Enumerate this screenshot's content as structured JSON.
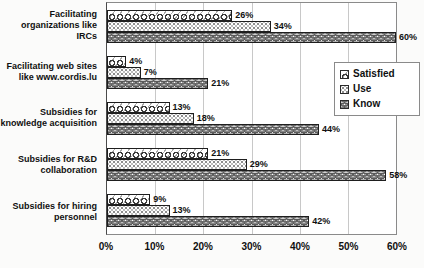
{
  "chart_data": {
    "type": "bar",
    "orientation": "horizontal",
    "title": "",
    "categories": [
      "Facilitating organizations like IRCs",
      "Facilitating web sites like www.cordis.lu",
      "Subsidies for knowledge acquisition",
      "Subsidies for R&D collaboration",
      "Subsidies for hiring personnel"
    ],
    "series": [
      {
        "name": "Satisfied",
        "pattern": "diagonal-scale-hatch",
        "values": [
          26,
          4,
          13,
          21,
          9
        ]
      },
      {
        "name": "Use",
        "pattern": "dot-grid",
        "values": [
          34,
          7,
          18,
          29,
          13
        ]
      },
      {
        "name": "Know",
        "pattern": "horizontal-waves",
        "values": [
          60,
          21,
          44,
          58,
          42
        ]
      }
    ],
    "x_ticks": [
      "0%",
      "10%",
      "20%",
      "30%",
      "40%",
      "50%",
      "60%"
    ],
    "xlim": [
      0,
      60
    ],
    "grid": "vertical-only",
    "value_label_suffix": "%",
    "legend": {
      "position": "inside-right",
      "entries": [
        "Satisfied",
        "Use",
        "Know"
      ]
    }
  },
  "colors": {
    "background": "#fbfbfa",
    "plot_background": "#ffffff",
    "bar_border": "#1e1e1e",
    "gridline": "#c8c8c8",
    "plot_border": "#8a8a8a",
    "text": "#101010",
    "pattern_ink": "#3a3a3a"
  }
}
